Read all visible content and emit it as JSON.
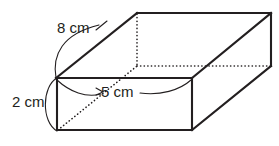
{
  "figure": {
    "shape": "rectangular-prism",
    "stroke_color": "#231f20",
    "hidden_edge_color": "#231f20",
    "background_color": "#ffffff",
    "labels": {
      "length": "8 cm",
      "height": "2 cm",
      "width": "5 cm"
    },
    "dimensions": [
      {
        "name": "length",
        "value": 8,
        "unit": "cm",
        "text": "8 cm"
      },
      {
        "name": "height",
        "value": 2,
        "unit": "cm",
        "text": "2 cm"
      },
      {
        "name": "width",
        "value": 5,
        "unit": "cm",
        "text": "5 cm"
      }
    ]
  }
}
